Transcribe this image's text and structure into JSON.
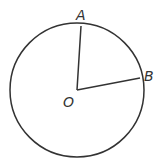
{
  "diagram": {
    "labels": {
      "A": "A",
      "B": "B",
      "O": "O"
    },
    "stroke_color": "#333333"
  }
}
